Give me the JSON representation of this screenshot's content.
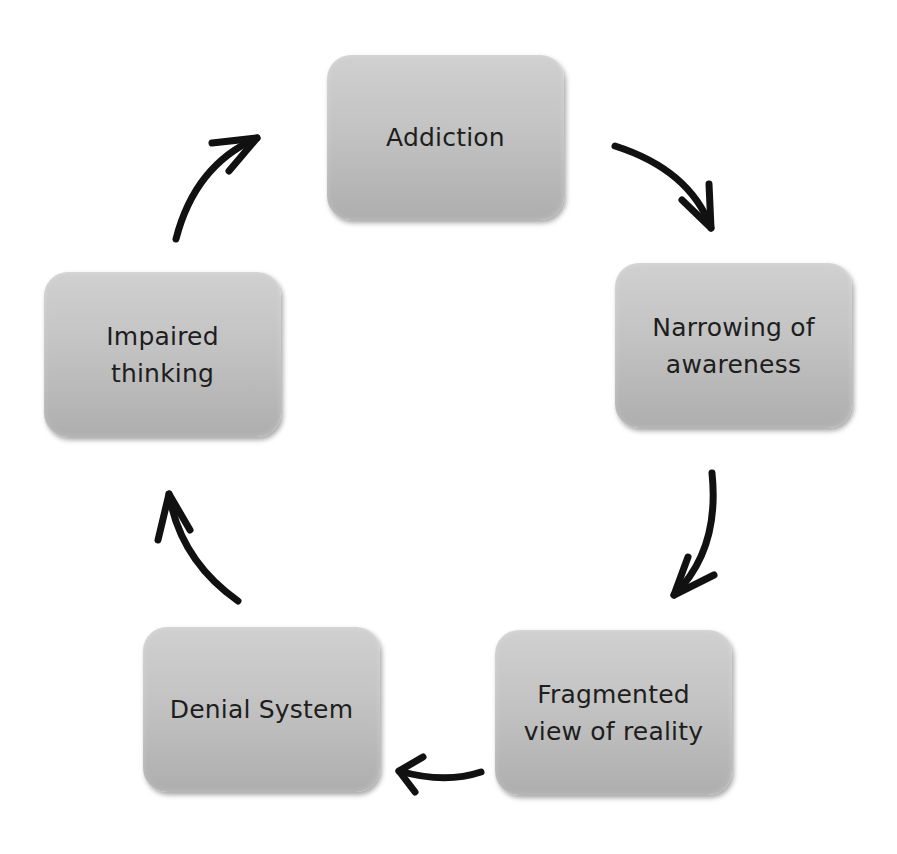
{
  "diagram": {
    "type": "cycle",
    "nodes": [
      {
        "id": "addiction",
        "label": "Addiction"
      },
      {
        "id": "narrowing",
        "label": "Narrowing of\nawareness"
      },
      {
        "id": "fragmented",
        "label": "Fragmented\nview of reality"
      },
      {
        "id": "denial",
        "label": "Denial System"
      },
      {
        "id": "impaired",
        "label": "Impaired\nthinking"
      }
    ],
    "edges": [
      {
        "from": "addiction",
        "to": "narrowing",
        "icon": "curved-arrow-icon"
      },
      {
        "from": "narrowing",
        "to": "fragmented",
        "icon": "curved-arrow-icon"
      },
      {
        "from": "fragmented",
        "to": "denial",
        "icon": "curved-arrow-icon"
      },
      {
        "from": "denial",
        "to": "impaired",
        "icon": "curved-arrow-icon"
      },
      {
        "from": "impaired",
        "to": "addiction",
        "icon": "curved-arrow-icon"
      }
    ],
    "colors": {
      "node_fill_top": "#d0d0d0",
      "node_fill_bottom": "#aeaeae",
      "text": "#1e1e1e",
      "arrow": "#111111",
      "background": "#ffffff"
    }
  }
}
